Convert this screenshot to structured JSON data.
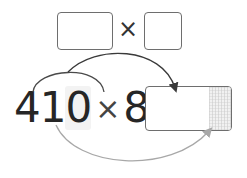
{
  "top_expression": {
    "left_box_value": "",
    "operator": "×",
    "right_box_value": ""
  },
  "equation": {
    "digits": [
      "4",
      "1",
      "0"
    ],
    "highlighted_digit_index": 2,
    "operator": "×",
    "multiplier": "8",
    "equals": "=",
    "answer_value": ""
  },
  "arrows": [
    {
      "name": "small-arc",
      "from": "4",
      "to": "8",
      "color": "#4a4a4a"
    },
    {
      "name": "top-arrow",
      "from": "small-arc",
      "to": "answer-box",
      "color": "#3a3a3a"
    },
    {
      "name": "bottom-arrow",
      "from": "0",
      "to": "answer-box-ones",
      "color": "#a8a8a8"
    }
  ],
  "colors": {
    "box_border": "#6e6e6e",
    "text": "#262626",
    "dark_arrow": "#3a3a3a",
    "light_arrow": "#a8a8a8",
    "shade": "#f1f1f1"
  }
}
